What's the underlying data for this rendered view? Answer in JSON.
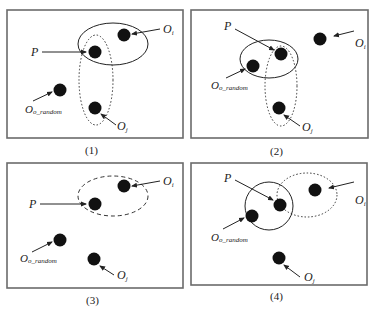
{
  "figure": {
    "panels": [
      {
        "caption": "(1)",
        "labels": {
          "p": "P",
          "oi": "O",
          "oi_sub": "i",
          "oj": "O",
          "oj_sub": "j",
          "oo": "O",
          "oo_sub": "o_random"
        },
        "solid_ellipse": "P and O_i",
        "dotted_ellipse": "P and O_j"
      },
      {
        "caption": "(2)",
        "labels": {
          "p": "P",
          "oi": "O",
          "oi_sub": "i",
          "oj": "O",
          "oj_sub": "j",
          "oo": "O",
          "oo_sub": "o_random"
        },
        "solid_ellipse": "P and O_o_random",
        "dotted_ellipse": "P and O_j"
      },
      {
        "caption": "(3)",
        "labels": {
          "p": "P",
          "oi": "O",
          "oi_sub": "i",
          "oj": "O",
          "oj_sub": "j",
          "oo": "O",
          "oo_sub": "o_random"
        },
        "dashed_ellipse": "P and O_i"
      },
      {
        "caption": "(4)",
        "labels": {
          "p": "P",
          "oi": "O",
          "oi_sub": "i",
          "oj": "O",
          "oj_sub": "j",
          "oo": "O",
          "oo_sub": "o_random"
        },
        "solid_circle": "P and O_o_random",
        "dotted_ellipse": "P and O_i"
      }
    ]
  }
}
